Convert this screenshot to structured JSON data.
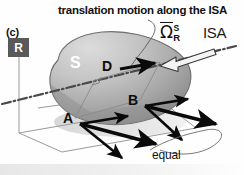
{
  "figure": {
    "panel_id": "(c)",
    "caption": "translation motion along the ISA",
    "reference_frame_label": "R",
    "body_label": "S",
    "isa_label": "ISA",
    "equal_label": "equal",
    "omega": {
      "symbol": "Ω",
      "superscript": "S",
      "subscript": "R"
    },
    "points": [
      {
        "name": "A",
        "label": "A"
      },
      {
        "name": "B",
        "label": "B"
      },
      {
        "name": "D",
        "label": "D"
      }
    ],
    "colors": {
      "background": "#fefefe",
      "body_fill_light": "#d2d2d2",
      "body_fill_dark": "#8d8d8d",
      "frame_box": "#595959",
      "frame_box_text": "#ffffff",
      "arrow": "#0a0a0a",
      "axes": "#9a9a9a",
      "isa_line": "#4a4a4a",
      "text": "#111111"
    }
  }
}
